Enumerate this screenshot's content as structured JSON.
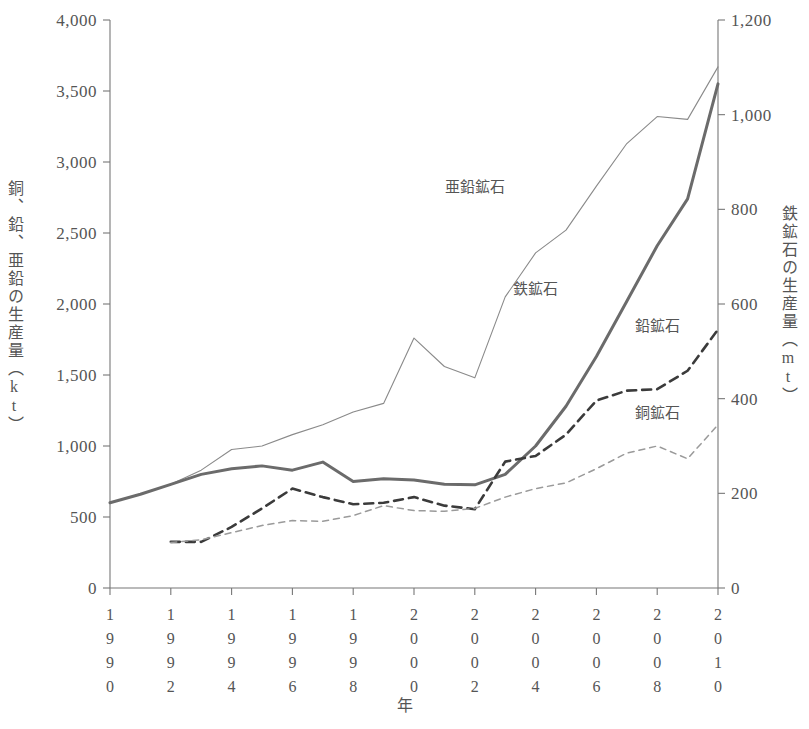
{
  "chart_data": {
    "type": "line",
    "title": "",
    "xlabel": "年",
    "ylabel": "銅、鉛、亜鉛の生産量（kt）",
    "y2label": "鉄鉱石の生産量（mt）",
    "xlim": [
      1990,
      2010
    ],
    "ylim": [
      0,
      4000
    ],
    "y2lim": [
      0,
      1200
    ],
    "grid": false,
    "legend_position": "inline-annotations",
    "x_tick_labels": [
      "1990",
      "1992",
      "1994",
      "1996",
      "1998",
      "2000",
      "2002",
      "2004",
      "2006",
      "2008",
      "2010"
    ],
    "y_tick_labels": [
      "0",
      "500",
      "1,000",
      "1,500",
      "2,000",
      "2,500",
      "3,000",
      "3,500",
      "4,000"
    ],
    "y_tick_values": [
      0,
      500,
      1000,
      1500,
      2000,
      2500,
      3000,
      3500,
      4000
    ],
    "y2_tick_labels": [
      "0",
      "200",
      "400",
      "600",
      "800",
      "1,000",
      "1,200"
    ],
    "y2_tick_values": [
      0,
      200,
      400,
      600,
      800,
      1000,
      1200
    ],
    "x": [
      1990,
      1991,
      1992,
      1993,
      1994,
      1995,
      1996,
      1997,
      1998,
      1999,
      2000,
      2001,
      2002,
      2003,
      2004,
      2005,
      2006,
      2007,
      2008,
      2009,
      2010
    ],
    "series": [
      {
        "name": "亜鉛鉱石",
        "axis": "left",
        "unit": "kt",
        "style": "solid-thin",
        "color": "#8a8a8a",
        "x": [
          1990,
          1991,
          1992,
          1993,
          1994,
          1995,
          1996,
          1997,
          1998,
          1999,
          2000,
          2001,
          2002,
          2003,
          2004,
          2005,
          2006,
          2007,
          2008,
          2009,
          2010
        ],
        "values": [
          600,
          660,
          730,
          830,
          975,
          1000,
          1080,
          1150,
          1240,
          1300,
          1760,
          1560,
          1480,
          2050,
          2360,
          2520,
          2830,
          3130,
          3320,
          3300,
          3670
        ],
        "label_text": "亜鉛鉱石"
      },
      {
        "name": "鉄鉱石",
        "axis": "right",
        "unit": "mt",
        "style": "solid-thick",
        "color": "#6b6b6b",
        "x": [
          1990,
          1991,
          1992,
          1993,
          1994,
          1995,
          1996,
          1997,
          1998,
          1999,
          2000,
          2001,
          2002,
          2003,
          2004,
          2005,
          2006,
          2007,
          2008,
          2009,
          2010
        ],
        "values_left_kt": [
          600,
          660,
          730,
          800,
          840,
          860,
          830,
          885,
          750,
          770,
          760,
          730,
          725,
          800,
          1000,
          1280,
          1630,
          2020,
          2410,
          2740,
          2920,
          3550
        ],
        "values": [
          180,
          198,
          219,
          240,
          252,
          258,
          249,
          266,
          225,
          231,
          228,
          219,
          218,
          240,
          300,
          384,
          489,
          606,
          723,
          822,
          1065
        ],
        "label_text": "鉄鉱石"
      },
      {
        "name": "鉛鉱石",
        "axis": "left",
        "unit": "kt",
        "style": "dashed-thick",
        "color": "#3b3b3b",
        "x": [
          1992,
          1993,
          1994,
          1995,
          1996,
          1997,
          1998,
          1999,
          2000,
          2001,
          2002,
          2003,
          2004,
          2005,
          2006,
          2007,
          2008,
          2009,
          2010
        ],
        "values": [
          325,
          325,
          430,
          560,
          700,
          640,
          590,
          600,
          640,
          580,
          555,
          890,
          930,
          1080,
          1320,
          1390,
          1400,
          1530,
          1820
        ],
        "label_text": "鉛鉱石"
      },
      {
        "name": "銅鉱石",
        "axis": "left",
        "unit": "kt",
        "style": "dashed-thin",
        "color": "#9a9a9a",
        "x": [
          1992,
          1993,
          1994,
          1995,
          1996,
          1997,
          1998,
          1999,
          2000,
          2001,
          2002,
          2003,
          2004,
          2005,
          2006,
          2007,
          2008,
          2009,
          2010
        ],
        "values": [
          320,
          340,
          390,
          440,
          475,
          470,
          510,
          580,
          545,
          540,
          560,
          640,
          700,
          740,
          840,
          950,
          1000,
          910,
          1150
        ],
        "label_text": "銅鉱石"
      }
    ],
    "annotations": [
      {
        "text": "亜鉛鉱石",
        "x": 2002,
        "y": 2790
      },
      {
        "text": "鉄鉱石",
        "x": 2004,
        "y": 2070
      },
      {
        "text": "鉛鉱石",
        "x": 2008,
        "y": 1810
      },
      {
        "text": "銅鉱石",
        "x": 2008,
        "y": 1200
      }
    ]
  },
  "axis_titles": {
    "left": "銅、鉛、亜鉛の生産量（kt）",
    "right": "鉄鉱石の生産量（mt）",
    "bottom": "年"
  }
}
